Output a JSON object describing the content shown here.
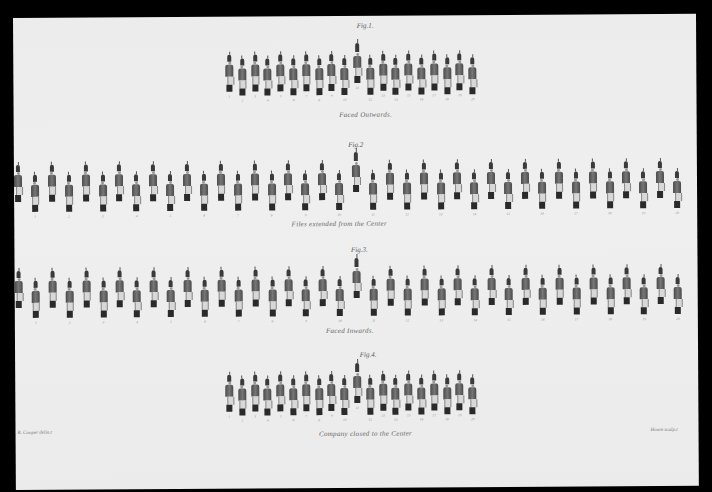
{
  "plate": {
    "figures": [
      {
        "id": "fig1",
        "label": "Fig.1.",
        "caption": "Faced Outwards.",
        "formation": "close",
        "label_pos": [
          352,
          6
        ],
        "caption_pos": [
          352,
          95
        ],
        "row_top": 38,
        "files": 20,
        "start_x": 212,
        "spacing": 12.8,
        "stagger": 4,
        "officer_index": 10
      },
      {
        "id": "fig2",
        "label": "Fig.2",
        "caption": "Files extended from the Center",
        "formation": "extended",
        "label_pos": [
          342,
          125
        ],
        "caption_pos": [
          325,
          204
        ],
        "row_top": 147,
        "files": 40,
        "start_x": 0,
        "spacing": 16.9,
        "stagger": 10,
        "officer_index": 20
      },
      {
        "id": "fig3",
        "label": "Fig.3.",
        "caption": "Faced Inwards.",
        "formation": "extended",
        "label_pos": [
          345,
          230
        ],
        "caption_pos": [
          335,
          311
        ],
        "row_top": 253,
        "files": 40,
        "start_x": 0,
        "spacing": 16.9,
        "stagger": 10,
        "officer_index": 20
      },
      {
        "id": "fig4",
        "label": "Fig.4.",
        "caption": "Company closed to the Center",
        "formation": "close",
        "label_pos": [
          353,
          335
        ],
        "caption_pos": [
          350,
          414
        ],
        "row_top": 358,
        "files": 20,
        "start_x": 210,
        "spacing": 12.8,
        "stagger": 4,
        "officer_index": 10
      }
    ],
    "file_numbers": [
      "1",
      "2",
      "3",
      "4",
      "5",
      "6",
      "7",
      "8",
      "9",
      "10",
      "11",
      "12",
      "13",
      "14",
      "15",
      "16",
      "17",
      "18",
      "19",
      "20"
    ],
    "credits": {
      "left": "R. Cooper delin.t",
      "right": "Hoare sculp.t"
    }
  },
  "colors": {
    "background": "#000000",
    "paper": "#ececec",
    "ink": "#3a3a3a"
  }
}
